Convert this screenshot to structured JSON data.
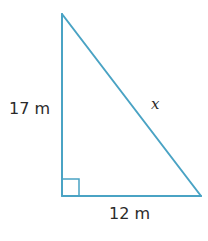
{
  "figure": {
    "type": "right-triangle",
    "stroke_color": "#4aa3c4",
    "text_color": "#2a2a2a",
    "vertices": {
      "top": [
        62,
        14
      ],
      "bottom_left": [
        62,
        196
      ],
      "bottom_right": [
        201,
        196
      ]
    },
    "right_angle_marker": {
      "corner": "bottom_left",
      "size": 17
    },
    "labels": {
      "vertical_leg": "17 m",
      "horizontal_leg": "12 m",
      "hypotenuse": "x"
    }
  }
}
